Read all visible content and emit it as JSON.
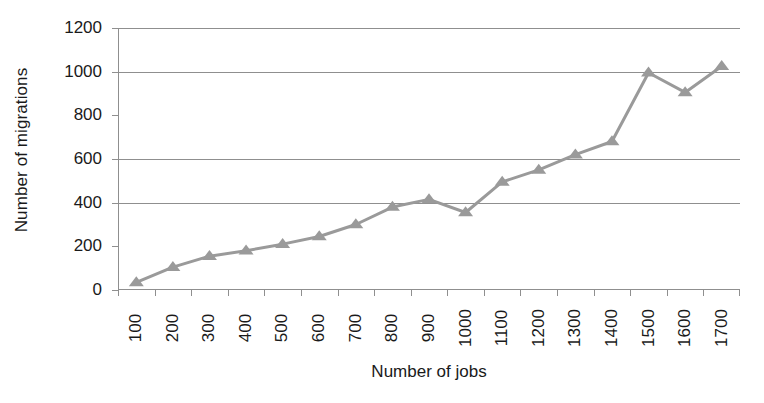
{
  "chart_data": {
    "type": "line",
    "title": "",
    "xlabel": "Number of jobs",
    "ylabel": "Number of migrations",
    "categories": [
      100,
      200,
      300,
      400,
      500,
      600,
      700,
      800,
      900,
      1000,
      1100,
      1200,
      1300,
      1400,
      1500,
      1600,
      1700
    ],
    "x_tick_labels": [
      "100",
      "200",
      "300",
      "400",
      "500",
      "600",
      "700",
      "800",
      "900",
      "1000",
      "1100",
      "1200",
      "1300",
      "1400",
      "1500",
      "1600",
      "1700"
    ],
    "values": [
      35,
      105,
      155,
      180,
      210,
      245,
      300,
      380,
      415,
      355,
      495,
      550,
      620,
      680,
      995,
      905,
      1025
    ],
    "ylim": [
      0,
      1200
    ],
    "y_ticks": [
      0,
      200,
      400,
      600,
      800,
      1000,
      1200
    ],
    "y_tick_labels": [
      "0",
      "200",
      "400",
      "600",
      "800",
      "1000",
      "1200"
    ],
    "gridline_values": [
      400,
      600,
      1000,
      1200
    ],
    "grid": true,
    "legend": "none",
    "marker": "triangle",
    "series_color": "#9a9a9a",
    "axis_color": "#8f8f8f",
    "text_color": "#1a1a1a",
    "background_color": "#ffffff",
    "x_tick_label_rotation": -90,
    "y_label_rotation": -90
  }
}
